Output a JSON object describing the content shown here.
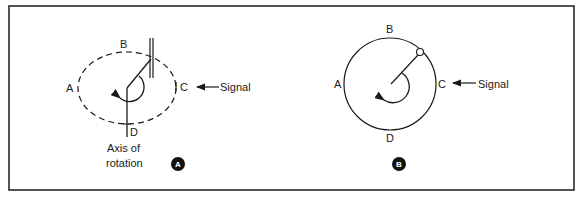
{
  "figure": {
    "panel_a": {
      "badge": "A",
      "labels": {
        "a": "A",
        "b": "B",
        "c": "C",
        "d": "D"
      },
      "signal_label": "Signal",
      "axis_label_line1": "Axis of",
      "axis_label_line2": "rotation",
      "orbit_style": "dashed"
    },
    "panel_b": {
      "badge": "B",
      "labels": {
        "a": "A",
        "b": "B",
        "c": "C",
        "d": "D"
      },
      "signal_label": "Signal",
      "orbit_style": "solid"
    },
    "colors": {
      "line": "#1a1a1a",
      "background": "#ffffff",
      "frame": "#2a2a2a"
    }
  }
}
